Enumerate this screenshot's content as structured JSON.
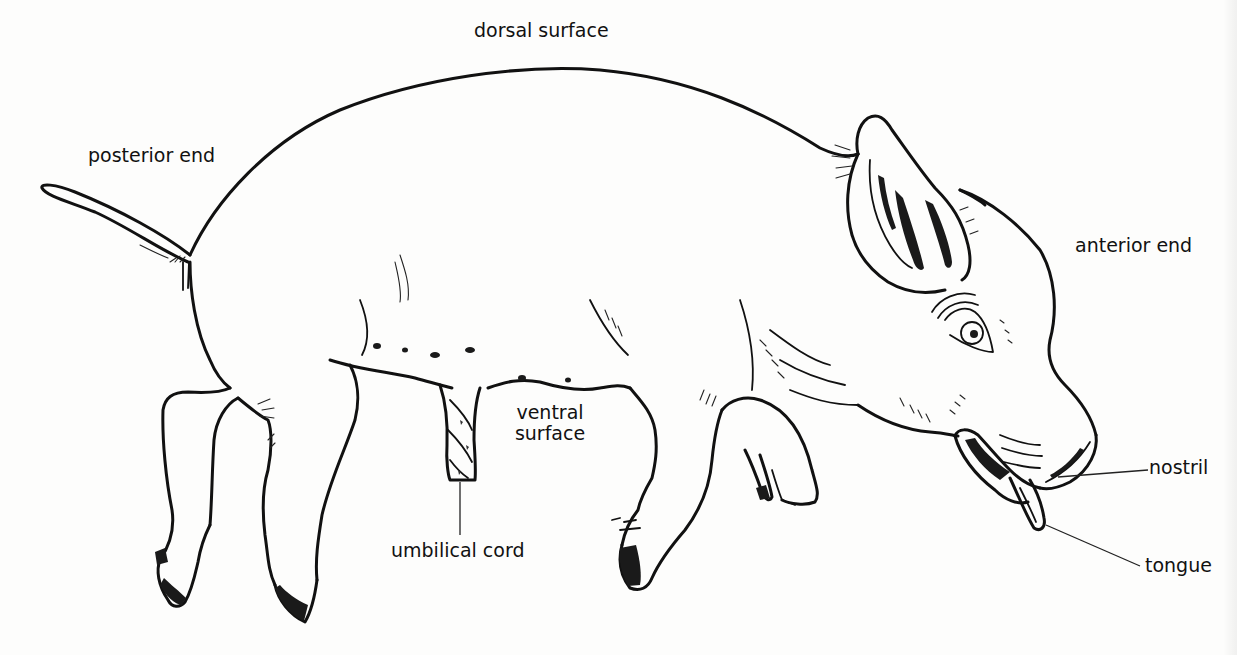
{
  "figure": {
    "colors": {
      "background": "#fdfdfc",
      "ink": "#111111"
    }
  },
  "labels": {
    "dorsal_surface": "dorsal surface",
    "posterior_end": "posterior end",
    "anterior_end": "anterior end",
    "ventral_surface_line1": "ventral",
    "ventral_surface_line2": "surface",
    "umbilical_cord": "umbilical cord",
    "nostril": "nostril",
    "tongue": "tongue"
  }
}
